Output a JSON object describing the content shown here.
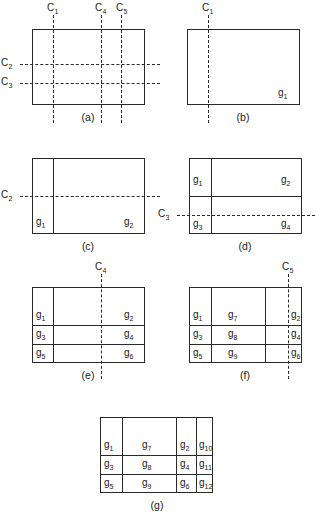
{
  "figure": {
    "cut_labels": {
      "c1": "C",
      "c1_sub": "1",
      "c2": "C",
      "c2_sub": "2",
      "c3": "C",
      "c3_sub": "3",
      "c4": "C",
      "c4_sub": "4",
      "c5": "C",
      "c5_sub": "5"
    },
    "region_symbol": "g",
    "panels": [
      {
        "id": "a",
        "label": "(a)",
        "cuts": [
          "C1",
          "C2",
          "C3",
          "C4",
          "C5"
        ],
        "regions": []
      },
      {
        "id": "b",
        "label": "(b)",
        "cuts": [
          "C1"
        ],
        "regions": [
          "g1"
        ]
      },
      {
        "id": "c",
        "label": "(c)",
        "cuts": [
          "C2"
        ],
        "regions": [
          "g1",
          "g2"
        ]
      },
      {
        "id": "d",
        "label": "(d)",
        "cuts": [
          "C3"
        ],
        "regions": [
          "g1",
          "g2",
          "g3",
          "g4"
        ]
      },
      {
        "id": "e",
        "label": "(e)",
        "cuts": [
          "C4"
        ],
        "regions": [
          "g1",
          "g2",
          "g3",
          "g4",
          "g5",
          "g6"
        ]
      },
      {
        "id": "f",
        "label": "(f)",
        "cuts": [
          "C5"
        ],
        "regions": [
          "g1",
          "g7",
          "g2",
          "g3",
          "g8",
          "g4",
          "g5",
          "g9",
          "g6"
        ]
      },
      {
        "id": "g",
        "label": "(g)",
        "cuts": [],
        "regions": [
          "g1",
          "g7",
          "g2",
          "g10",
          "g3",
          "g8",
          "g4",
          "g11",
          "g5",
          "g9",
          "g6",
          "g12"
        ]
      }
    ],
    "subscripts": {
      "s1": "1",
      "s2": "2",
      "s3": "3",
      "s4": "4",
      "s5": "5",
      "s6": "6",
      "s7": "7",
      "s8": "8",
      "s9": "9",
      "s10": "10",
      "s11": "11",
      "s12": "12"
    },
    "colors": {
      "line": "#2a2a2a",
      "background": "#ffffff",
      "text": "#1a1a1a"
    }
  }
}
